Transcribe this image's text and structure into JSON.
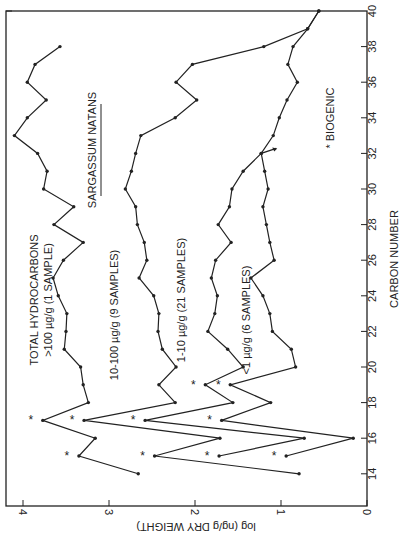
{
  "chart_data": {
    "type": "line",
    "orientation": "rotated-90-ccw",
    "title": "SARGASSUM NATANS",
    "xlabel": "CARBON NUMBER",
    "ylabel": "log (ng/g DRY WEIGHT)",
    "xlim": [
      13,
      40
    ],
    "ylim": [
      0,
      4.2
    ],
    "x_ticks": [
      14,
      16,
      18,
      20,
      22,
      24,
      26,
      28,
      30,
      32,
      34,
      36,
      38,
      40
    ],
    "y_ticks": [
      0,
      1,
      2,
      3,
      4
    ],
    "grid": false,
    "legend_note": "* BIOGENIC",
    "biogenic_marker": "*",
    "series": [
      {
        "name": "TOTAL HYDROCARBONS >100 µg/g (1 SAMPLE)",
        "label_lines": [
          "TOTAL  HYDROCARBONS",
          ">100 µg/g (1 SAMPLE)"
        ],
        "x": [
          14,
          15,
          16,
          17,
          18,
          19,
          20,
          21,
          22,
          23,
          24,
          25,
          26,
          27,
          28,
          29,
          30,
          31,
          32,
          33,
          34,
          35,
          36,
          37,
          38
        ],
        "values": [
          2.66,
          3.35,
          3.16,
          3.77,
          3.24,
          3.3,
          3.33,
          3.52,
          3.5,
          3.49,
          3.59,
          3.65,
          3.53,
          3.3,
          3.64,
          3.41,
          3.76,
          3.72,
          3.83,
          4.1,
          3.95,
          3.73,
          3.95,
          3.86,
          3.57
        ],
        "biogenic": [
          15,
          17
        ]
      },
      {
        "name": "10-100 µg/g (9 SAMPLES)",
        "label_lines": [
          "10-100 µg/g (9 SAMPLES)"
        ],
        "x": [
          14,
          15,
          16,
          17,
          18,
          19,
          20,
          21,
          22,
          23,
          24,
          25,
          26,
          27,
          28,
          29,
          30,
          31,
          32,
          33,
          34,
          35,
          36,
          37,
          38,
          39,
          40
        ],
        "values": [
          0.79,
          2.47,
          1.71,
          3.29,
          2.23,
          2.42,
          2.22,
          2.38,
          2.43,
          2.42,
          2.48,
          2.65,
          2.56,
          2.59,
          2.67,
          2.69,
          2.81,
          2.74,
          2.69,
          2.63,
          2.23,
          1.98,
          2.22,
          2.03,
          1.2,
          0.69,
          0.56
        ],
        "biogenic": [
          15,
          17
        ]
      },
      {
        "name": "1-10 µg/g (21 SAMPLES)",
        "label_lines": [
          "1-10 µg/g (21 SAMPLES)"
        ],
        "x": [
          15,
          16,
          17,
          18,
          19,
          20,
          21,
          22,
          23,
          24,
          25,
          26,
          27,
          28,
          29,
          30,
          31,
          32,
          33,
          34,
          35,
          36,
          37,
          38,
          39,
          40
        ],
        "values": [
          1.72,
          0.73,
          2.58,
          1.56,
          1.88,
          1.44,
          1.62,
          1.85,
          1.77,
          1.74,
          1.81,
          1.76,
          1.58,
          1.73,
          1.6,
          1.57,
          1.44,
          1.23,
          1.09,
          1.02,
          0.93,
          0.81,
          0.92,
          0.86,
          0.69,
          0.56
        ],
        "biogenic": [
          15,
          17,
          19
        ]
      },
      {
        "name": "<1 µg/g (6 SAMPLES)",
        "label_lines": [
          "<1 µg/g (6 SAMPLES)"
        ],
        "x": [
          15,
          16,
          17,
          18,
          19,
          20,
          21,
          22,
          23,
          24,
          25,
          26,
          27,
          28,
          29,
          30,
          31,
          32
        ],
        "values": [
          0.94,
          0.16,
          1.69,
          1.12,
          1.59,
          0.83,
          0.88,
          1.1,
          1.13,
          1.21,
          1.35,
          1.08,
          1.13,
          1.17,
          1.21,
          1.15,
          1.19,
          1.23
        ],
        "biogenic": [
          15,
          17,
          19
        ],
        "end_arrow": true
      }
    ]
  },
  "labels": {
    "title": "SARGASSUM NATANS",
    "xlabel": "CARBON NUMBER",
    "ylabel": "log (ng/g DRY WEIGHT)",
    "biogenic_legend": "* BIOGENIC"
  }
}
